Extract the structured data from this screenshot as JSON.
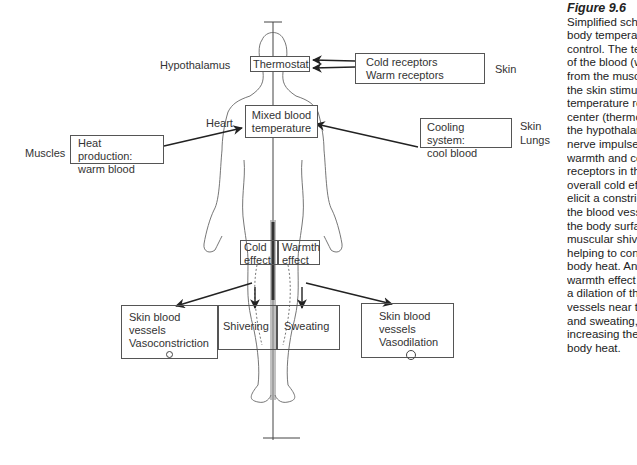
{
  "figure": {
    "title": "Figure 9.6",
    "caption_lines": [
      "Simplified scheme of",
      "body temperature",
      "control. The temperature",
      "of the blood (warm blood",
      "from the muscles, cooling by",
      "the skin stimulates the",
      "temperature regulatory",
      "center (thermostat) in",
      "the hypothalamus, as do",
      "nerve impulses from",
      "warmth and cold",
      "receptors in the skin. An",
      "overall cold effect will",
      "elicit a constriction of",
      "the blood vessels near",
      "the body surface and",
      "muscular shivering,",
      "helping to conserve",
      "body heat. An overall",
      "warmth effect will elicit",
      "a dilation of the blood",
      "vessels near the surface",
      "and sweating, thus",
      "increasing the loss of",
      "body heat."
    ]
  },
  "labels": {
    "hypothalamus": "Hypothalamus",
    "skin_top": "Skin",
    "heart": "Heart",
    "muscles": "Muscles",
    "skin_right": "Skin",
    "lungs": "Lungs"
  },
  "boxes": {
    "thermostat": "Thermostat",
    "receptors": [
      "Cold receptors",
      "Warm receptors"
    ],
    "mixed_blood": [
      "Mixed blood",
      "temperature"
    ],
    "heat_production": [
      "Heat production:",
      "warm blood"
    ],
    "cooling_system": [
      "Cooling system:",
      "cool blood"
    ],
    "cold_effect": [
      "Cold",
      "effect"
    ],
    "warmth_effect": [
      "Warmth",
      "effect"
    ],
    "vasoconstriction": [
      "Skin blood",
      "vessels",
      "Vasoconstriction"
    ],
    "shivering": "Shivering",
    "sweating": "Sweating",
    "vasodilation": [
      "Skin blood",
      "vessels",
      "Vasodilation"
    ]
  },
  "colors": {
    "line": "#333333",
    "body_outline": "#555555",
    "box_border": "#555555"
  }
}
